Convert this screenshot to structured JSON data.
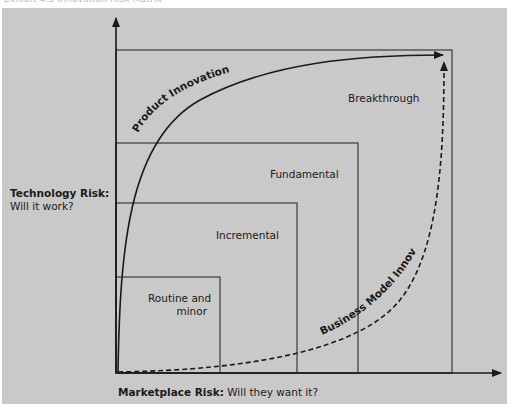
{
  "caption": "Exhibit 4.5   Innovation Risk Matrix",
  "axes": {
    "y_label_bold": "Technology Risk:",
    "y_label_text": "Will it work?",
    "x_label_bold": "Marketplace Risk:",
    "x_label_text": " Will they want it?"
  },
  "regions": [
    {
      "label": "Routine and",
      "label2": "minor"
    },
    {
      "label": "Incremental"
    },
    {
      "label": "Fundamental"
    },
    {
      "label": "Breakthrough"
    }
  ],
  "curves": {
    "product": "Product Innovation",
    "business": "Business Model Innovation"
  },
  "colors": {
    "background": "#c9c9c9",
    "line": "#1a1a1a",
    "box": "#3a3a3a"
  }
}
